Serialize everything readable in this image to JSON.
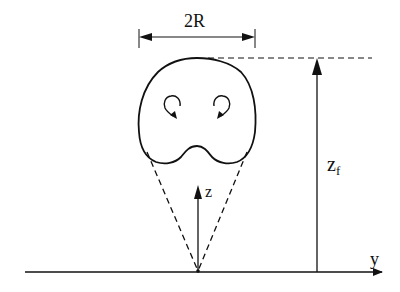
{
  "diagram": {
    "labels": {
      "width": "2R",
      "height_main": "z",
      "height_sub": "f",
      "vertical_axis": "z",
      "horizontal_axis": "y"
    },
    "elements": [
      "cloud-outline",
      "left-vortex",
      "right-vortex",
      "width-dimension-arrow",
      "height-dimension-arrow",
      "top-reference-dashed-line",
      "spread-cone-dashed-lines",
      "z-axis-arrow",
      "y-axis-baseline"
    ],
    "colors": {
      "stroke": "#111111",
      "background": "#ffffff"
    }
  }
}
